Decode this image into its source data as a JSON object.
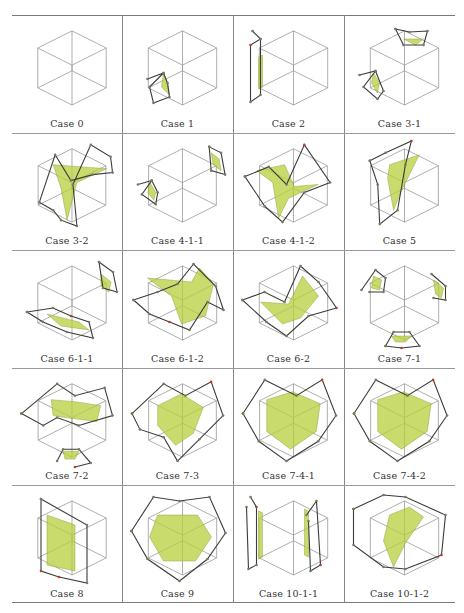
{
  "figure": {
    "colors": {
      "cube_edge": "#9a9a9a",
      "dual_edge": "#3b3b3b",
      "dual_vertex": "#6f7f5a",
      "marked_vertex": "#c0392b",
      "surface": "#b8cf3c",
      "surface_dark": "#7d9426",
      "rule": "#7a7a7a"
    },
    "cells": [
      {
        "caption": "Case 0"
      },
      {
        "caption": "Case 1"
      },
      {
        "caption": "Case 2"
      },
      {
        "caption": "Case 3-1"
      },
      {
        "caption": "Case 3-2"
      },
      {
        "caption": "Case 4-1-1"
      },
      {
        "caption": "Case 4-1-2"
      },
      {
        "caption": "Case 5"
      },
      {
        "caption": "Case 6-1-1"
      },
      {
        "caption": "Case 6-1-2"
      },
      {
        "caption": "Case 6-2"
      },
      {
        "caption": "Case 7-1"
      },
      {
        "caption": "Case 7-2"
      },
      {
        "caption": "Case 7-3"
      },
      {
        "caption": "Case 7-4-1"
      },
      {
        "caption": "Case 7-4-2"
      },
      {
        "caption": "Case 8"
      },
      {
        "caption": "Case 9"
      },
      {
        "caption": "Case 10-1-1"
      },
      {
        "caption": "Case 10-1-2"
      }
    ]
  }
}
